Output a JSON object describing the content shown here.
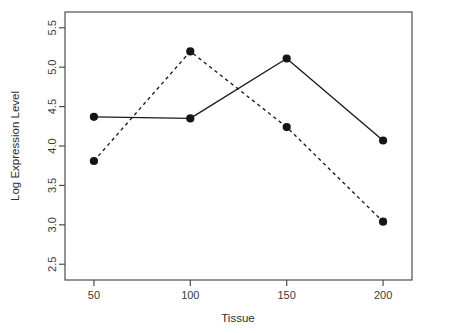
{
  "chart_data": {
    "type": "line",
    "title": "",
    "xlabel": "Tissue",
    "ylabel": "Log Expression Level",
    "x": [
      50,
      100,
      150,
      200
    ],
    "xticks": [
      "50",
      "100",
      "150",
      "200"
    ],
    "yticks": [
      "2.5",
      "3.0",
      "3.5",
      "4.0",
      "4.5",
      "5.0",
      "5.5"
    ],
    "ytick_values": [
      2.5,
      3.0,
      3.5,
      4.0,
      4.5,
      5.0,
      5.5
    ],
    "xlim": [
      35,
      215
    ],
    "ylim": [
      2.3,
      5.7
    ],
    "grid": false,
    "legend": "none",
    "series": [
      {
        "name": "series-solid",
        "linestyle": "solid",
        "marker": "filled-circle",
        "color": "#151515",
        "values": [
          4.37,
          4.35,
          5.11,
          4.07
        ]
      },
      {
        "name": "series-dashed",
        "linestyle": "dashed",
        "marker": "filled-circle",
        "color": "#151515",
        "values": [
          3.81,
          5.2,
          4.24,
          3.04
        ]
      }
    ]
  },
  "axes": {
    "x_title": "Tissue",
    "y_title": "Log Expression Level"
  }
}
